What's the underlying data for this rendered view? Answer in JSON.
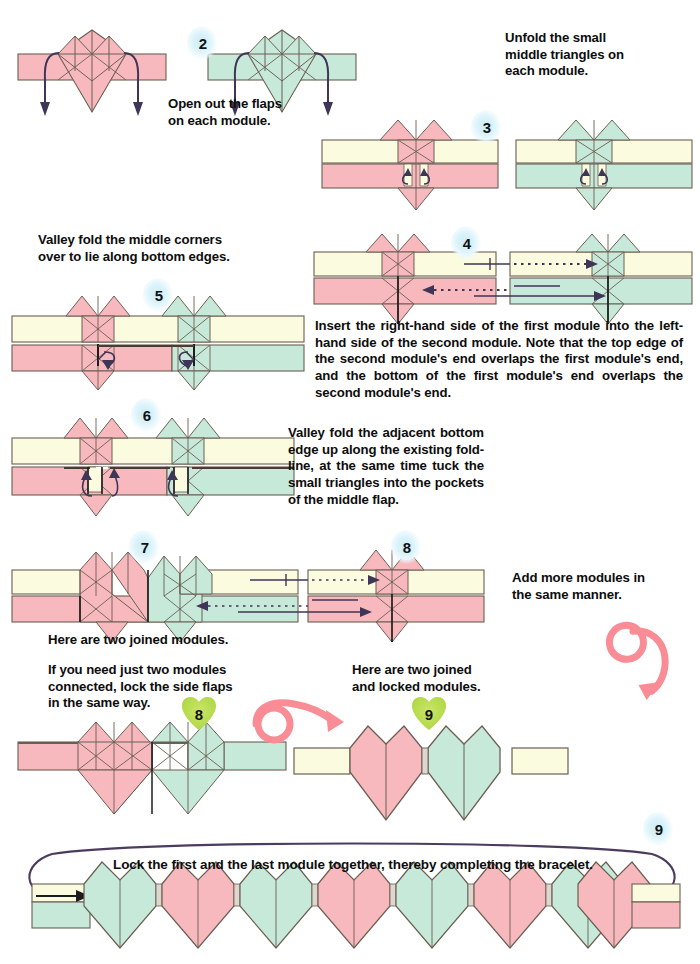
{
  "page": {
    "width": 700,
    "height": 964
  },
  "palette": {
    "pink": "#f7b9be",
    "pink_dark": "#e9a0a6",
    "teal": "#c6e9da",
    "teal_dark": "#aadcc7",
    "cream": "#fbfbe0",
    "cream_dark": "#f2f1c8",
    "outline": "#6b5f52",
    "arrow": "#3f3556",
    "badge_blue": "#cdeef8",
    "badge_green": "#b6db4e",
    "turnover_pink": "#f98c94",
    "paper_white": "#ffffff"
  },
  "steps": [
    {
      "id": "step-2",
      "number": "2",
      "caption": "Open out the flaps\non each module."
    },
    {
      "id": "step-3",
      "number": "3",
      "caption": "Unfold the small\nmiddle triangles on\neach module."
    },
    {
      "id": "step-4",
      "number": "4",
      "caption": "Insert the right-hand side of the first module into the left-hand side of the second module. Note that the top edge of the second module's end overlaps the first module's end, and the bottom of the first module's end overlaps the second module's end."
    },
    {
      "id": "step-5",
      "number": "5",
      "caption": "Valley fold the middle corners\nover to lie along bottom edges."
    },
    {
      "id": "step-6",
      "number": "6",
      "caption": "Valley fold the adjacent bottom edge up along the existing fold-line, at the same time tuck the small triangles into the pockets of the middle flap."
    },
    {
      "id": "step-7",
      "number": "7",
      "caption": "Here are two joined modules."
    },
    {
      "id": "step-8-top",
      "number": "8",
      "caption": "Add more modules in\nthe same manner."
    },
    {
      "id": "step-8-lock",
      "number": "8",
      "caption": "If you need just two modules\nconnected, lock the side flaps\nin the same way."
    },
    {
      "id": "step-9-locked",
      "number": "9",
      "caption": "Here are two joined\nand locked modules."
    },
    {
      "id": "step-9-bracelet",
      "number": "9",
      "caption": "Lock the first and the last module together, thereby completing the bracelet."
    }
  ],
  "bracelet": {
    "heart_colors": [
      "teal",
      "pink",
      "teal",
      "pink",
      "teal",
      "pink",
      "teal",
      "pink"
    ],
    "heart_count": 8,
    "left_end_tab": "cream",
    "right_end_tab": "cream"
  },
  "symbols": {
    "turn_over_large": "turn-over-arrow",
    "turn_over_small": "turn-over-arrow",
    "valley_fold_arrow": "valley-fold-arrow",
    "insert_arrow": "insert-arrow",
    "dotted_arrow": "hidden-edge-arrow"
  },
  "footer": {
    "note": ""
  }
}
